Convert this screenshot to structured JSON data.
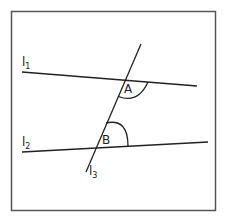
{
  "diagram": {
    "type": "geometry",
    "lines": [
      {
        "id": "l1",
        "label": "l",
        "subscript": "1"
      },
      {
        "id": "l2",
        "label": "l",
        "subscript": "2"
      },
      {
        "id": "l3",
        "label": "l",
        "subscript": "3"
      }
    ],
    "angles": [
      {
        "id": "A",
        "label": "A"
      },
      {
        "id": "B",
        "label": "B"
      }
    ],
    "colors": {
      "stroke": "#222222",
      "frame": "#555555",
      "background": "#ffffff"
    }
  }
}
